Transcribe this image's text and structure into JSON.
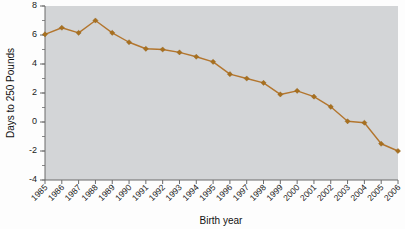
{
  "chart_data": {
    "type": "line",
    "title": "",
    "xlabel": "Birth year",
    "ylabel": "Days to 250 Pounds",
    "xlim": [
      1985,
      2006
    ],
    "ylim": [
      -4,
      8
    ],
    "y_ticks": [
      8,
      6,
      4,
      2,
      0,
      -2,
      -4
    ],
    "y_tick_labels": [
      "8",
      "6",
      "4",
      "2",
      "0",
      "-2",
      "-4"
    ],
    "y_minor_tick_step": 1,
    "grid": false,
    "legend": null,
    "series_color": "#a8701f",
    "plot_background": "#d3d5d7",
    "marker": "diamond",
    "categories": [
      "1985",
      "1986",
      "1987",
      "1988",
      "1989",
      "1990",
      "1991",
      "1992",
      "1993",
      "1994",
      "1995",
      "1996",
      "1997",
      "1998",
      "1999",
      "2000",
      "2001",
      "2002",
      "2003",
      "2004",
      "2005",
      "2006"
    ],
    "values": [
      6.05,
      6.5,
      6.15,
      7.0,
      6.15,
      5.5,
      5.05,
      5.0,
      4.8,
      4.5,
      4.15,
      3.3,
      3.0,
      2.7,
      1.9,
      2.15,
      1.75,
      1.05,
      0.05,
      -0.05,
      -1.5,
      -2.0
    ],
    "points": [
      {
        "x": "1985",
        "y": 6.05
      },
      {
        "x": "1986",
        "y": 6.5
      },
      {
        "x": "1987",
        "y": 6.15
      },
      {
        "x": "1988",
        "y": 7.0
      },
      {
        "x": "1989",
        "y": 6.15
      },
      {
        "x": "1990",
        "y": 5.5
      },
      {
        "x": "1991",
        "y": 5.05
      },
      {
        "x": "1992",
        "y": 5.0
      },
      {
        "x": "1993",
        "y": 4.8
      },
      {
        "x": "1994",
        "y": 4.5
      },
      {
        "x": "1995",
        "y": 4.15
      },
      {
        "x": "1996",
        "y": 3.3
      },
      {
        "x": "1997",
        "y": 3.0
      },
      {
        "x": "1998",
        "y": 2.7
      },
      {
        "x": "1999",
        "y": 1.9
      },
      {
        "x": "2000",
        "y": 2.15
      },
      {
        "x": "2001",
        "y": 1.75
      },
      {
        "x": "2002",
        "y": 1.05
      },
      {
        "x": "2003",
        "y": 0.05
      },
      {
        "x": "2004",
        "y": -0.05
      },
      {
        "x": "2005",
        "y": -1.5
      },
      {
        "x": "2006",
        "y": -2.0
      }
    ]
  }
}
